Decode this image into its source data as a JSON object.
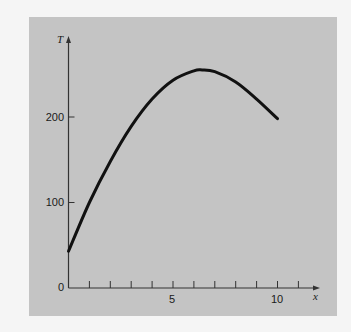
{
  "chart_data": {
    "type": "line",
    "title": "",
    "xlabel": "x",
    "ylabel": "T",
    "xlim": [
      0,
      11.8
    ],
    "ylim": [
      0,
      300
    ],
    "grid": false,
    "legend": null,
    "x_ticks": [
      1,
      2,
      3,
      4,
      5,
      6,
      7,
      8,
      9,
      10,
      11
    ],
    "x_tick_labels": [
      {
        "value": 5,
        "label": "5"
      },
      {
        "value": 10,
        "label": "10"
      }
    ],
    "y_ticks": [
      {
        "value": 0,
        "label": "0"
      },
      {
        "value": 100,
        "label": "100"
      },
      {
        "value": 200,
        "label": "200"
      }
    ],
    "series": [
      {
        "name": "T(x)",
        "x": [
          0,
          1,
          2,
          3,
          4,
          5,
          6,
          6.4,
          7,
          8,
          9,
          10
        ],
        "values": [
          43,
          100,
          148,
          189,
          221,
          243,
          254,
          255,
          253,
          241,
          221,
          198
        ]
      }
    ]
  },
  "labels": {
    "y_axis": "T",
    "x_axis": "x",
    "y_tick_0": "0",
    "y_tick_100": "100",
    "y_tick_200": "200",
    "x_tick_5": "5",
    "x_tick_10": "10"
  },
  "colors": {
    "panel": "#c4c4c4",
    "background": "#f5f5f5",
    "curve": "#111111",
    "axis": "#333333"
  }
}
